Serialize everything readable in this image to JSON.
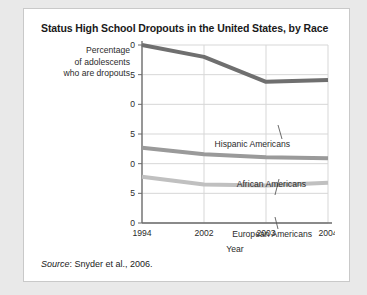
{
  "figure": {
    "title": "Status High School Dropouts in the United States, by Race",
    "source_prefix": "Source",
    "source_rest": ": Snyder et al., 2006.",
    "axis_caption_line1": "Percentage",
    "axis_caption_line2": "of adolescents",
    "axis_caption_line3": "who are dropouts"
  },
  "chart_data": {
    "type": "line",
    "title": "Status High School Dropouts in the United States, by Race",
    "xlabel": "Year",
    "ylabel": "Percentage of adolescents who are dropouts",
    "categories": [
      "1994",
      "2002",
      "2003",
      "2004"
    ],
    "x_tick_labels": [
      "1994",
      "2002",
      "2003",
      "2004"
    ],
    "y_tick_labels": [
      "0",
      "5",
      "10",
      "15",
      "20",
      "25",
      "30"
    ],
    "y_ticks": [
      0,
      5,
      10,
      15,
      20,
      25,
      30
    ],
    "ylim": [
      0,
      30
    ],
    "grid": true,
    "legend_position": "inline-annotations",
    "series": [
      {
        "name": "Hispanic Americans",
        "values": [
          30.0,
          28.0,
          23.8,
          24.1
        ],
        "color": "#6f6f6f"
      },
      {
        "name": "African Americans",
        "values": [
          12.7,
          11.6,
          11.1,
          10.9
        ],
        "color": "#9a9a9a"
      },
      {
        "name": "European Americans",
        "values": [
          7.8,
          6.5,
          6.3,
          6.8
        ],
        "color": "#c0c0c0"
      }
    ]
  },
  "colors": {
    "card_background": "#ffffff",
    "page_background": "#e9e9e9",
    "card_border": "#c9c9c9",
    "grid": "#d7d7d7",
    "axis": "#6a6a6a",
    "text": "#1a1a1a"
  }
}
